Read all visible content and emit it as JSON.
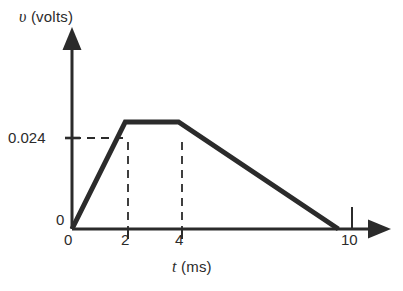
{
  "chart_data": {
    "type": "line",
    "title": "",
    "subtitle": "",
    "xlabel": "t (ms)",
    "ylabel": "v (volts)",
    "xlabel_symbol": "t",
    "xlabel_unit": "(ms)",
    "ylabel_symbol": "υ",
    "ylabel_unit": "(volts)",
    "x": [
      0,
      2,
      4,
      10
    ],
    "y": [
      0,
      0.024,
      0.024,
      0
    ],
    "series": [
      {
        "name": "v(t)",
        "x": [
          0,
          2,
          4,
          10
        ],
        "values": [
          0,
          0.024,
          0.024,
          0
        ]
      }
    ],
    "xlim": [
      0,
      11.3
    ],
    "ylim": [
      0,
      0.0415
    ],
    "xticks": [
      0,
      2,
      4,
      10
    ],
    "xtick_labels": [
      "0",
      "2",
      "4",
      "10"
    ],
    "yticks": [
      0,
      0.024
    ],
    "ytick_labels": [
      "0",
      "0.024"
    ],
    "grid": false,
    "legend": false,
    "legend_position": "none",
    "annotations": [
      {
        "name": "peak-value-guide",
        "type": "dashed-horizontal",
        "y": 0.024,
        "x_from": 0,
        "x_to": 2
      },
      {
        "name": "rise-end-guide",
        "type": "dashed-vertical",
        "x": 2,
        "y_from": 0,
        "y_to": 0.024
      },
      {
        "name": "plateau-end-guide",
        "type": "dashed-vertical",
        "x": 4,
        "y_from": 0,
        "y_to": 0.024
      }
    ]
  },
  "axes": {
    "y_title": "(volts)",
    "y_symbol": "υ",
    "x_title": "(ms)",
    "x_symbol": "t",
    "y_tick_peak": "0.024",
    "y_tick_zero": "0",
    "x_tick_zero": "0",
    "x_tick_two": "2",
    "x_tick_four": "4",
    "x_tick_ten": "10"
  },
  "style": {
    "background": "#ffffff",
    "ink": "#2b2b2b",
    "curve_color": "#2b2b2b",
    "axis_color": "#2b2b2b",
    "dash_color": "#2b2b2b"
  }
}
